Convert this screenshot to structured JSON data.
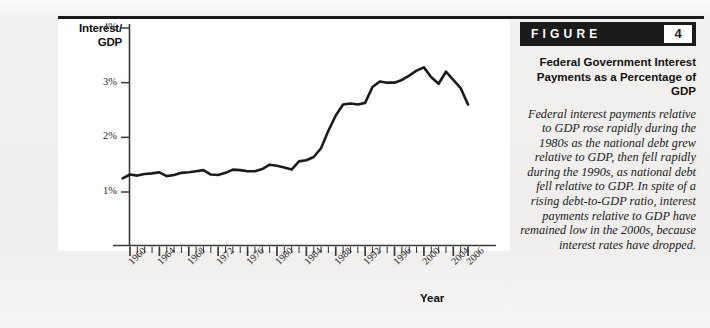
{
  "figure": {
    "badge_word": "FIGURE",
    "badge_number": "4",
    "title": "Federal Government Interest Payments as a Percentage of GDP",
    "body": "Federal interest payments relative to GDP rose rapidly during the 1980s as the national debt grew relative to GDP, then fell rapidly during the 1990s, as national debt fell relative to GDP. In spite of a rising debt-to-GDP ratio, interest payments relative to GDP have remained low in the 2000s, because interest rates have dropped."
  },
  "colors": {
    "line": "#1b1b1b",
    "axis": "#3a3a3a",
    "page_background": "#f1f0ee",
    "plot_background": "#ffffff",
    "badge_background": "#1b1b1b",
    "badge_text": "#ffffff"
  },
  "chart_data": {
    "type": "line",
    "title": "Federal Government Interest Payments as a Percentage of GDP",
    "xlabel": "Year",
    "ylabel": "Interest/ GDP",
    "grid": false,
    "legend": null,
    "xlim": [
      1959,
      2007
    ],
    "ylim": [
      0,
      4
    ],
    "ytick_labels": [
      "4%",
      "3%",
      "2%",
      "1%"
    ],
    "ytick_values": [
      4,
      3,
      2,
      1
    ],
    "xtick_labels": [
      "1960",
      "1964",
      "1968",
      "1972",
      "1976",
      "1980",
      "1984",
      "1988",
      "1992",
      "1996",
      "2000",
      "2004",
      "2006"
    ],
    "xtick_values": [
      1960,
      1964,
      1968,
      1972,
      1976,
      1980,
      1984,
      1988,
      1992,
      1996,
      2000,
      2004,
      2006
    ],
    "minor_tick_interval": 1,
    "x": [
      1959,
      1960,
      1961,
      1962,
      1963,
      1964,
      1965,
      1966,
      1967,
      1968,
      1969,
      1970,
      1971,
      1972,
      1973,
      1974,
      1975,
      1976,
      1977,
      1978,
      1979,
      1980,
      1981,
      1982,
      1983,
      1984,
      1985,
      1986,
      1987,
      1988,
      1989,
      1990,
      1991,
      1992,
      1993,
      1994,
      1995,
      1996,
      1997,
      1998,
      1999,
      2000,
      2001,
      2002,
      2003,
      2004,
      2005,
      2006
    ],
    "y": [
      1.25,
      1.32,
      1.3,
      1.33,
      1.34,
      1.36,
      1.29,
      1.31,
      1.35,
      1.36,
      1.38,
      1.4,
      1.32,
      1.31,
      1.35,
      1.41,
      1.4,
      1.38,
      1.38,
      1.42,
      1.5,
      1.48,
      1.45,
      1.41,
      1.56,
      1.58,
      1.64,
      1.8,
      2.12,
      2.4,
      2.6,
      2.62,
      2.6,
      2.63,
      2.92,
      3.02,
      3.0,
      3.0,
      3.05,
      3.13,
      3.22,
      3.28,
      3.1,
      2.98,
      3.2,
      3.05,
      2.9,
      2.6
    ],
    "y_units": "percent of GDP",
    "series_name": "Federal interest payments / GDP"
  }
}
